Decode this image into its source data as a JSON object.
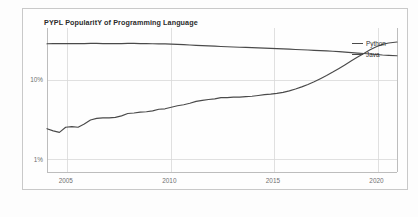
{
  "chart_data": {
    "type": "line",
    "title": "PYPL PopularitY of Programming Language",
    "xlabel": "",
    "ylabel": "",
    "yscale": "log",
    "ylim": [
      0.7,
      45
    ],
    "xlim": [
      2004.0,
      2020.9
    ],
    "grid": true,
    "legend_position": "right-outside",
    "ytick_labels": [
      "10%",
      "1%"
    ],
    "ytick_values": [
      10,
      1
    ],
    "xtick_labels": [
      "2005",
      "2010",
      "2015",
      "2020"
    ],
    "xtick_values": [
      2005,
      2010,
      2015,
      2020
    ],
    "series": [
      {
        "name": "Python",
        "color": "#4a4a4a",
        "x": [
          2004.0,
          2004.3,
          2004.6,
          2004.9,
          2005.2,
          2005.5,
          2005.8,
          2006.1,
          2006.4,
          2006.7,
          2007.0,
          2007.3,
          2007.6,
          2007.9,
          2008.2,
          2008.5,
          2008.8,
          2009.1,
          2009.4,
          2009.7,
          2010.0,
          2010.3,
          2010.6,
          2010.9,
          2011.2,
          2011.5,
          2011.8,
          2012.1,
          2012.4,
          2012.7,
          2013.0,
          2013.3,
          2013.6,
          2013.9,
          2014.2,
          2014.5,
          2014.8,
          2015.1,
          2015.4,
          2015.7,
          2016.0,
          2016.3,
          2016.6,
          2016.9,
          2017.2,
          2017.5,
          2017.8,
          2018.1,
          2018.4,
          2018.7,
          2019.0,
          2019.3,
          2019.6,
          2019.9,
          2020.2,
          2020.5,
          2020.9
        ],
        "y": [
          2.45,
          2.3,
          2.2,
          2.55,
          2.6,
          2.55,
          2.8,
          3.15,
          3.3,
          3.35,
          3.35,
          3.4,
          3.55,
          3.8,
          3.85,
          3.95,
          4.0,
          4.1,
          4.3,
          4.35,
          4.55,
          4.75,
          4.9,
          5.1,
          5.4,
          5.55,
          5.7,
          5.8,
          6.0,
          6.0,
          6.1,
          6.1,
          6.2,
          6.25,
          6.4,
          6.55,
          6.65,
          6.8,
          7.0,
          7.3,
          7.7,
          8.2,
          8.8,
          9.5,
          10.4,
          11.4,
          12.6,
          14.0,
          15.6,
          17.4,
          19.4,
          21.6,
          24.0,
          26.2,
          28.0,
          29.2,
          30.0
        ]
      },
      {
        "name": "Java",
        "color": "#4a4a4a",
        "x": [
          2004.0,
          2004.3,
          2004.6,
          2004.9,
          2005.2,
          2005.5,
          2005.8,
          2006.1,
          2006.4,
          2006.7,
          2007.0,
          2007.3,
          2007.6,
          2007.9,
          2008.2,
          2008.5,
          2008.8,
          2009.1,
          2009.4,
          2009.7,
          2010.0,
          2010.3,
          2010.6,
          2010.9,
          2011.2,
          2011.5,
          2011.8,
          2012.1,
          2012.4,
          2012.7,
          2013.0,
          2013.3,
          2013.6,
          2013.9,
          2014.2,
          2014.5,
          2014.8,
          2015.1,
          2015.4,
          2015.7,
          2016.0,
          2016.3,
          2016.6,
          2016.9,
          2017.2,
          2017.5,
          2017.8,
          2018.1,
          2018.4,
          2018.7,
          2019.0,
          2019.3,
          2019.6,
          2019.9,
          2020.2,
          2020.5,
          2020.9
        ],
        "y": [
          28.5,
          28.6,
          28.7,
          28.6,
          28.6,
          28.6,
          28.7,
          28.8,
          28.8,
          28.7,
          28.7,
          28.6,
          28.7,
          28.8,
          28.8,
          28.7,
          28.6,
          28.5,
          28.5,
          28.4,
          28.2,
          28.0,
          27.8,
          27.5,
          27.2,
          27.0,
          26.8,
          26.6,
          26.4,
          26.2,
          26.0,
          25.8,
          25.7,
          25.5,
          25.3,
          25.1,
          25.0,
          24.8,
          24.6,
          24.4,
          24.2,
          24.0,
          23.8,
          23.6,
          23.4,
          23.2,
          23.0,
          22.7,
          22.4,
          22.1,
          21.8,
          21.5,
          21.2,
          20.9,
          20.6,
          20.4,
          20.2
        ]
      }
    ]
  },
  "legend": {
    "items": [
      {
        "label": "Python"
      },
      {
        "label": "Java"
      }
    ]
  }
}
